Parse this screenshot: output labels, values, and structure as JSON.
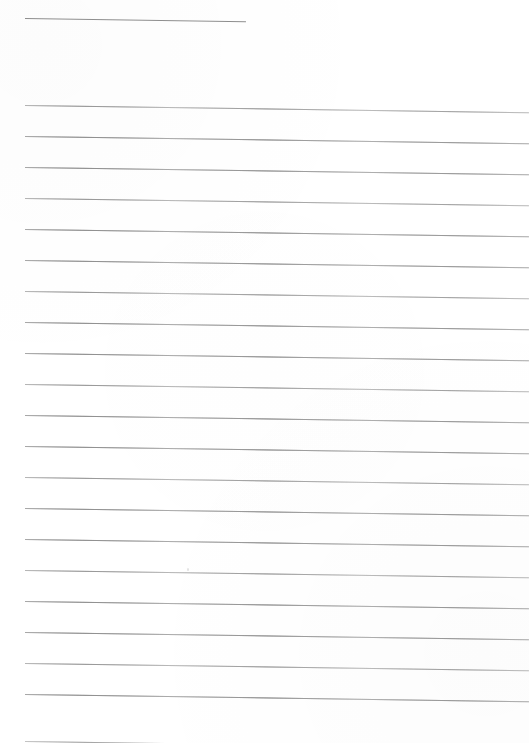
{
  "document": {
    "kind": "scanned-lined-paper",
    "content_text": "",
    "page_width": 529,
    "page_height": 743,
    "background_color": "#ffffff",
    "rule_color": "#9e9e9e",
    "skew_degrees": 0.82,
    "left_margin_x": 25,
    "header_rule": {
      "x": 25,
      "y": 18,
      "length": 221,
      "color": "#8f8f8f"
    },
    "line_spacing": 30.8,
    "line_count": 21,
    "lines": [
      {
        "index": 1,
        "x": 25,
        "y": 105,
        "length": 504,
        "weight": "soft"
      },
      {
        "index": 2,
        "x": 25,
        "y": 136,
        "length": 504,
        "weight": "normal"
      },
      {
        "index": 3,
        "x": 25,
        "y": 167,
        "length": 504,
        "weight": "normal"
      },
      {
        "index": 4,
        "x": 25,
        "y": 198,
        "length": 504,
        "weight": "soft"
      },
      {
        "index": 5,
        "x": 25,
        "y": 229,
        "length": 504,
        "weight": "normal"
      },
      {
        "index": 6,
        "x": 25,
        "y": 260,
        "length": 504,
        "weight": "normal"
      },
      {
        "index": 7,
        "x": 25,
        "y": 291,
        "length": 504,
        "weight": "soft"
      },
      {
        "index": 8,
        "x": 25,
        "y": 322,
        "length": 504,
        "weight": "normal"
      },
      {
        "index": 9,
        "x": 25,
        "y": 353,
        "length": 504,
        "weight": "normal"
      },
      {
        "index": 10,
        "x": 25,
        "y": 384,
        "length": 504,
        "weight": "soft"
      },
      {
        "index": 11,
        "x": 25,
        "y": 415,
        "length": 504,
        "weight": "normal"
      },
      {
        "index": 12,
        "x": 25,
        "y": 446,
        "length": 504,
        "weight": "normal"
      },
      {
        "index": 13,
        "x": 25,
        "y": 477,
        "length": 504,
        "weight": "soft"
      },
      {
        "index": 14,
        "x": 25,
        "y": 508,
        "length": 504,
        "weight": "normal"
      },
      {
        "index": 15,
        "x": 25,
        "y": 539,
        "length": 504,
        "weight": "normal"
      },
      {
        "index": 16,
        "x": 25,
        "y": 570,
        "length": 504,
        "weight": "soft"
      },
      {
        "index": 17,
        "x": 25,
        "y": 601,
        "length": 504,
        "weight": "normal"
      },
      {
        "index": 18,
        "x": 25,
        "y": 632,
        "length": 504,
        "weight": "normal"
      },
      {
        "index": 19,
        "x": 25,
        "y": 663,
        "length": 504,
        "weight": "soft"
      },
      {
        "index": 20,
        "x": 25,
        "y": 694,
        "length": 504,
        "weight": "normal"
      },
      {
        "index": 21,
        "x": 25,
        "y": 741,
        "length": 504,
        "weight": "faint"
      }
    ],
    "artifacts": [
      {
        "name": "scan-speck",
        "x": 187,
        "y": 568
      }
    ]
  }
}
